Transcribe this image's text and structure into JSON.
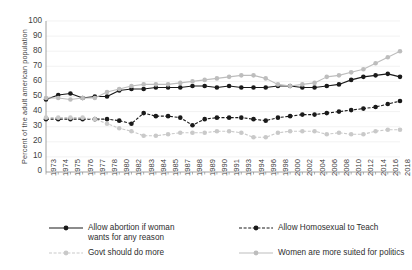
{
  "chart_data": {
    "type": "line",
    "title": "",
    "xlabel": "",
    "ylabel": "Percent of the adult american population",
    "ylim": [
      0,
      100
    ],
    "ytick_step": 10,
    "grid": true,
    "legend_position": "bottom",
    "yticks": [
      "100",
      "90",
      "80",
      "70",
      "60",
      "50",
      "40",
      "30",
      "20",
      "10",
      "0"
    ],
    "categories": [
      "1973",
      "1974",
      "1975",
      "1976",
      "1977",
      "1978",
      "1980",
      "1982",
      "1983",
      "1984",
      "1985",
      "1987",
      "1988",
      "1989",
      "1990",
      "1991",
      "1993",
      "1994",
      "1996",
      "1998",
      "2000",
      "2002",
      "2004",
      "2006",
      "2008",
      "2010",
      "2012",
      "2014",
      "2016",
      "2018"
    ],
    "series": [
      {
        "name": "Allow abortion if woman wants for any reason",
        "color": "#1a1a1a",
        "style": "solid",
        "values": [
          48,
          51,
          52,
          49,
          50,
          50,
          54,
          55,
          55,
          56,
          56,
          56,
          57,
          57,
          56,
          57,
          56,
          56,
          56,
          57,
          57,
          56,
          56,
          57,
          58,
          61,
          63,
          64,
          65,
          63
        ]
      },
      {
        "name": "Allow Homosexual to Teach",
        "color": "#1a1a1a",
        "style": "dashed",
        "values": [
          35,
          35,
          35,
          35,
          35,
          35,
          34,
          32,
          39,
          37,
          37,
          36,
          31,
          35,
          36,
          36,
          36,
          35,
          34,
          36,
          37,
          38,
          38,
          39,
          40,
          41,
          42,
          43,
          45,
          47
        ]
      },
      {
        "name": "Govt should do more",
        "color": "#c9c9c9",
        "style": "dashed",
        "values": [
          36,
          36,
          36,
          36,
          35,
          32,
          29,
          27,
          24,
          24,
          25,
          26,
          26,
          26,
          27,
          27,
          26,
          23,
          23,
          26,
          27,
          27,
          27,
          25,
          26,
          25,
          25,
          27,
          28,
          28
        ]
      },
      {
        "name": "Women are more suited for politics",
        "color": "#bdbdbd",
        "style": "solid",
        "values": [
          49,
          49,
          48,
          49,
          49,
          53,
          55,
          57,
          58,
          58,
          58,
          59,
          60,
          61,
          62,
          63,
          64,
          64,
          62,
          58,
          57,
          58,
          59,
          63,
          64,
          66,
          68,
          72,
          76,
          80
        ]
      }
    ]
  },
  "legend": {
    "items": [
      {
        "label_line1": "Allow abortion if woman",
        "label_line2": "wants for any reason",
        "key": "allow-abortion"
      },
      {
        "label_line1": "Allow Homosexual to Teach",
        "label_line2": "",
        "key": "allow-homosexual-to-teach"
      },
      {
        "label_line1": "Govt should do more",
        "label_line2": "",
        "key": "govt-should-do-more"
      },
      {
        "label_line1": "Women are more suited for politics",
        "label_line2": "",
        "key": "women-more-suited"
      }
    ]
  }
}
